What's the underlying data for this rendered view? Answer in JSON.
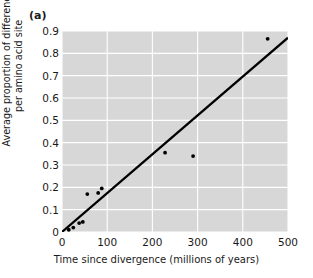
{
  "figure": {
    "panel_label": "(a)",
    "background_color": "#ffffff",
    "plot_background_color": "#d7d7d7",
    "gridline_color": "#ffffff",
    "axis_color": "#000000",
    "marker_color": "#000000",
    "line_color": "#000000"
  },
  "chart_data": {
    "type": "scatter",
    "title": "(a)",
    "xlabel": "Time since divergence (millions of years)",
    "ylabel": "Average proportion of differences per amino acid site",
    "ylabel_lines": [
      "Average proportion of differences",
      "per amino acid site"
    ],
    "xlim": [
      0,
      500
    ],
    "ylim": [
      0,
      0.9
    ],
    "xticks": [
      0,
      100,
      200,
      300,
      400,
      500
    ],
    "yticks": [
      0,
      0.1,
      0.2,
      0.3,
      0.4,
      0.5,
      0.6,
      0.7,
      0.8,
      0.9
    ],
    "xtick_labels": [
      "0",
      "100",
      "200",
      "300",
      "400",
      "500"
    ],
    "ytick_labels": [
      "0",
      "0.1",
      "0.2",
      "0.3",
      "0.4",
      "0.5",
      "0.6",
      "0.7",
      "0.8",
      "0.9"
    ],
    "grid": true,
    "grid_color": "#ffffff",
    "legend": null,
    "series": [
      {
        "name": "Observed species pairs",
        "type": "scatter",
        "marker": "dot",
        "points": [
          {
            "x": 15,
            "y": 0.01
          },
          {
            "x": 25,
            "y": 0.02
          },
          {
            "x": 38,
            "y": 0.04
          },
          {
            "x": 46,
            "y": 0.045
          },
          {
            "x": 56,
            "y": 0.17
          },
          {
            "x": 80,
            "y": 0.175
          },
          {
            "x": 88,
            "y": 0.195
          },
          {
            "x": 228,
            "y": 0.355
          },
          {
            "x": 290,
            "y": 0.34
          },
          {
            "x": 455,
            "y": 0.865
          }
        ]
      },
      {
        "name": "Molecular clock regression line",
        "type": "line",
        "endpoints": [
          {
            "x": 0,
            "y": 0.0
          },
          {
            "x": 500,
            "y": 0.87
          }
        ],
        "slope": 0.00174,
        "intercept": 0.0
      }
    ]
  }
}
